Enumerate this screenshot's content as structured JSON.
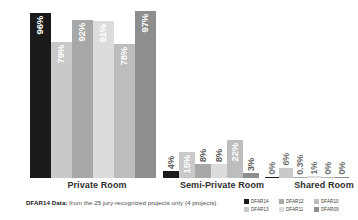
{
  "chart_data": {
    "type": "bar",
    "title": "",
    "subtitle": "",
    "xlabel": "",
    "ylabel": "",
    "ylim": [
      0,
      100
    ],
    "grid": false,
    "legend_position": "bottom-right",
    "orientation": "vertical",
    "grouping": "clustered",
    "value_suffix": "%",
    "categories": [
      "Private Room",
      "Semi-Private Room",
      "Shared Room"
    ],
    "series": [
      {
        "name": "DFAR14",
        "color": "#1a1a1a",
        "values": [
          96,
          79,
          0
        ]
      },
      {
        "name": "DFAR13",
        "color": "#c9c9c9",
        "values": [
          79,
          15,
          6
        ]
      },
      {
        "name": "DFAR12",
        "color": "#a8a8a8",
        "values": [
          92,
          8,
          0.3
        ]
      },
      {
        "name": "DFAR11",
        "color": "#dcdcdc",
        "values": [
          91,
          8,
          1
        ]
      },
      {
        "name": "DFAR10",
        "color": "#bdbdbd",
        "values": [
          78,
          22,
          0
        ]
      },
      {
        "name": "DFAR09",
        "color": "#8e8e8e",
        "values": [
          97,
          3,
          0
        ]
      }
    ],
    "bars": [
      {
        "category": "Private Room",
        "items": [
          {
            "series": "DFAR14",
            "value": 96,
            "label": "96%",
            "color": "#1a1a1a",
            "label_placement": "inside"
          },
          {
            "series": "DFAR13",
            "value": 79,
            "label": "79%",
            "color": "#c9c9c9",
            "label_placement": "inside"
          },
          {
            "series": "DFAR12",
            "value": 92,
            "label": "92%",
            "color": "#a8a8a8",
            "label_placement": "inside"
          },
          {
            "series": "DFAR11",
            "value": 91,
            "label": "91%",
            "color": "#dcdcdc",
            "label_placement": "inside"
          },
          {
            "series": "DFAR10",
            "value": 78,
            "label": "78%",
            "color": "#bdbdbd",
            "label_placement": "inside"
          },
          {
            "series": "DFAR09",
            "value": 97,
            "label": "97%",
            "color": "#8e8e8e",
            "label_placement": "inside"
          }
        ]
      },
      {
        "category": "Semi-Private Room",
        "items": [
          {
            "series": "DFAR14",
            "value": 4,
            "label": "4%",
            "color": "#1a1a1a",
            "label_placement": "outside"
          },
          {
            "series": "DFAR13",
            "value": 15,
            "label": "15%",
            "color": "#c9c9c9",
            "label_placement": "inside"
          },
          {
            "series": "DFAR12",
            "value": 8,
            "label": "8%",
            "color": "#a8a8a8",
            "label_placement": "outside"
          },
          {
            "series": "DFAR11",
            "value": 8,
            "label": "8%",
            "color": "#dcdcdc",
            "label_placement": "outside"
          },
          {
            "series": "DFAR10",
            "value": 22,
            "label": "22%",
            "color": "#bdbdbd",
            "label_placement": "inside"
          },
          {
            "series": "DFAR09",
            "value": 3,
            "label": "3%",
            "color": "#8e8e8e",
            "label_placement": "outside"
          }
        ]
      },
      {
        "category": "Shared Room",
        "items": [
          {
            "series": "DFAR14",
            "value": 0,
            "label": "0%",
            "color": "#1a1a1a",
            "label_placement": "outside"
          },
          {
            "series": "DFAR13",
            "value": 6,
            "label": "6%",
            "color": "#c9c9c9",
            "label_placement": "outside"
          },
          {
            "series": "DFAR12",
            "value": 0.3,
            "label": "0.3%",
            "color": "#a8a8a8",
            "label_placement": "outside"
          },
          {
            "series": "DFAR11",
            "value": 1,
            "label": "1%",
            "color": "#dcdcdc",
            "label_placement": "outside"
          },
          {
            "series": "DFAR10",
            "value": 0,
            "label": "0%",
            "color": "#bdbdbd",
            "label_placement": "outside"
          },
          {
            "series": "DFAR09",
            "value": 0,
            "label": "0%",
            "color": "#8e8e8e",
            "label_placement": "outside"
          }
        ]
      }
    ]
  },
  "footnote": {
    "emphasis": "DFAR14 Data:",
    "text": " from the 25 jury-recognized projects only (4 projects)"
  },
  "legend": {
    "items": [
      {
        "label": "DFAR14",
        "color": "#1a1a1a"
      },
      {
        "label": "DFAR12",
        "color": "#a8a8a8"
      },
      {
        "label": "DFAR10",
        "color": "#bdbdbd"
      },
      {
        "label": "DFAR13",
        "color": "#c9c9c9"
      },
      {
        "label": "DFAR11",
        "color": "#dcdcdc"
      },
      {
        "label": "DFAR09",
        "color": "#8e8e8e"
      }
    ]
  }
}
